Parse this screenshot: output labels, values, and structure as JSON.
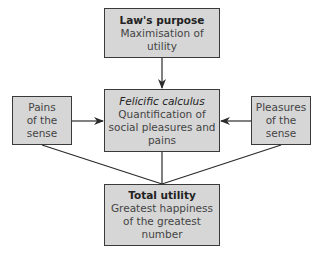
{
  "diagram": {
    "nodes": {
      "top": {
        "title": "Law's purpose",
        "body_lines": [
          "Maximisation of",
          "utility"
        ]
      },
      "center": {
        "title": "Felicific calculus",
        "body_lines": [
          "Quantification of",
          "social pleasures and",
          "pains"
        ]
      },
      "left": {
        "body_lines": [
          "Pains",
          "of the",
          "sense"
        ]
      },
      "right": {
        "body_lines": [
          "Pleasures",
          "of the",
          "sense"
        ]
      },
      "bottom": {
        "title": "Total utility",
        "body_lines": [
          "Greatest happiness",
          "of the greatest",
          "number"
        ]
      }
    },
    "edges": [
      {
        "from": "top",
        "to": "center",
        "type": "arrow"
      },
      {
        "from": "left",
        "to": "center",
        "type": "arrow"
      },
      {
        "from": "right",
        "to": "center",
        "type": "arrow"
      },
      {
        "from": "center",
        "to": "bottom",
        "type": "line"
      },
      {
        "from": "left",
        "to": "bottom",
        "type": "line"
      },
      {
        "from": "right",
        "to": "bottom",
        "type": "line"
      }
    ],
    "colors": {
      "box_fill": "#d6d6d6",
      "border": "#3a3a3a",
      "background": "#ffffff"
    }
  }
}
